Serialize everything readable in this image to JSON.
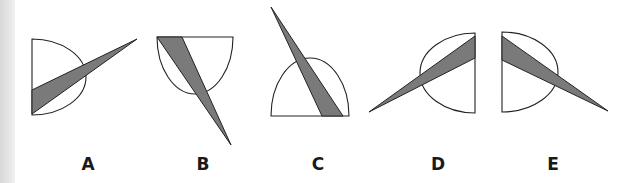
{
  "colors": {
    "outline": "#222222",
    "wedge_fill": "#7a7a7a",
    "background": "#ffffff"
  },
  "options": [
    {
      "label": "A",
      "label_x": 88,
      "semicircle": {
        "cx": 32,
        "cy": 77,
        "rx": 54,
        "ry": 38,
        "orientation": "right"
      },
      "wedge": [
        [
          32,
          90
        ],
        [
          32,
          114
        ],
        [
          137,
          39
        ]
      ]
    },
    {
      "label": "B",
      "label_x": 203,
      "semicircle": {
        "cx": 195,
        "cy": 37,
        "rx": 38,
        "ry": 57,
        "orientation": "down"
      },
      "wedge": [
        [
          157,
          37
        ],
        [
          182,
          37
        ],
        [
          231,
          145
        ]
      ]
    },
    {
      "label": "C",
      "label_x": 318,
      "semicircle": {
        "cx": 310,
        "cy": 116,
        "rx": 39,
        "ry": 58,
        "orientation": "up"
      },
      "wedge": [
        [
          271,
          7
        ],
        [
          322,
          116
        ],
        [
          343,
          116
        ]
      ]
    },
    {
      "label": "D",
      "label_x": 438,
      "semicircle": {
        "cx": 475,
        "cy": 73,
        "rx": 55,
        "ry": 40,
        "orientation": "left"
      },
      "wedge": [
        [
          475,
          36
        ],
        [
          475,
          58
        ],
        [
          369,
          112
        ]
      ]
    },
    {
      "label": "E",
      "label_x": 553,
      "semicircle": {
        "cx": 502,
        "cy": 72,
        "rx": 56,
        "ry": 40,
        "orientation": "right"
      },
      "wedge": [
        [
          502,
          36
        ],
        [
          502,
          60
        ],
        [
          608,
          111
        ]
      ]
    }
  ]
}
